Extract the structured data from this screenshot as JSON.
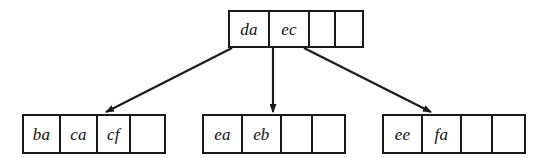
{
  "figure": {
    "type": "b-tree",
    "title": "",
    "order": 5,
    "node_capacity": 4,
    "levels": 2
  },
  "nodes": {
    "root": {
      "id": "root",
      "role": "root-node",
      "cells": [
        "da",
        "ec",
        "",
        ""
      ],
      "filled_count": 2,
      "x": 228,
      "y": 10,
      "width": 136,
      "height": 38
    },
    "leaf_left": {
      "id": "leaf-left",
      "role": "leaf-node",
      "cells": [
        "ba",
        "ca",
        "cf",
        ""
      ],
      "filled_count": 3,
      "x": 22,
      "y": 114,
      "width": 144,
      "height": 40
    },
    "leaf_middle": {
      "id": "leaf-middle",
      "role": "leaf-node",
      "cells": [
        "ea",
        "eb",
        "",
        ""
      ],
      "filled_count": 2,
      "x": 202,
      "y": 114,
      "width": 144,
      "height": 40
    },
    "leaf_right": {
      "id": "leaf-right",
      "role": "leaf-node",
      "cells": [
        "ee",
        "fa",
        "",
        ""
      ],
      "filled_count": 2,
      "x": 382,
      "y": 114,
      "width": 144,
      "height": 40
    }
  },
  "edges": [
    {
      "id": "edge-root-to-left",
      "from": "root",
      "to": "leaf_left",
      "x1": 232,
      "y1": 48,
      "x2": 106,
      "y2": 112,
      "arrowhead": true
    },
    {
      "id": "edge-root-to-middle",
      "from": "root",
      "to": "leaf_middle",
      "x1": 273,
      "y1": 48,
      "x2": 273,
      "y2": 112,
      "arrowhead": true
    },
    {
      "id": "edge-root-to-right",
      "from": "root",
      "to": "leaf_right",
      "x1": 304,
      "y1": 48,
      "x2": 431,
      "y2": 112,
      "arrowhead": true
    }
  ],
  "colors": {
    "ink": "#1a1a1a",
    "text": "#111111",
    "background": "#ffffff"
  }
}
